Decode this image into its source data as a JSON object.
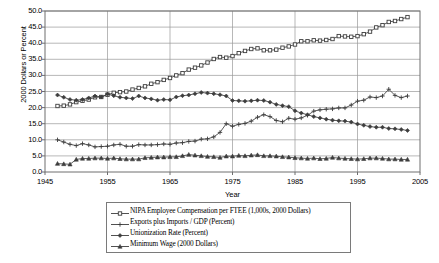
{
  "chart_data": {
    "type": "line",
    "title": "",
    "xlabel": "Year",
    "ylabel": "2000 Dollars or Percent",
    "xlim": [
      1945,
      2005
    ],
    "ylim": [
      0.0,
      50.0
    ],
    "xticks": [
      "1945",
      "1955",
      "1965",
      "1975",
      "1985",
      "1995",
      "2005"
    ],
    "xtick_values": [
      1945,
      1955,
      1965,
      1975,
      1985,
      1995,
      2005
    ],
    "yticks": [
      "0.0",
      "5.0",
      "10.0",
      "15.0",
      "20.0",
      "25.0",
      "30.0",
      "35.0",
      "40.0",
      "45.0",
      "50.0"
    ],
    "ytick_values": [
      0,
      5,
      10,
      15,
      20,
      25,
      30,
      35,
      40,
      45,
      50
    ],
    "grid": "horizontal-and-vertical",
    "legend_position": "below-plot",
    "x": [
      1947,
      1948,
      1949,
      1950,
      1951,
      1952,
      1953,
      1954,
      1955,
      1956,
      1957,
      1958,
      1959,
      1960,
      1961,
      1962,
      1963,
      1964,
      1965,
      1966,
      1967,
      1968,
      1969,
      1970,
      1971,
      1972,
      1973,
      1974,
      1975,
      1976,
      1977,
      1978,
      1979,
      1980,
      1981,
      1982,
      1983,
      1984,
      1985,
      1986,
      1987,
      1988,
      1989,
      1990,
      1991,
      1992,
      1993,
      1994,
      1995,
      1996,
      1997,
      1998,
      1999,
      2000,
      2001,
      2002,
      2003
    ],
    "series": [
      {
        "name": "NIPA Employee Compensation per FTEE (1,000s, 2000 Dollars)",
        "marker": "square",
        "values": [
          20.5,
          20.6,
          21.0,
          21.7,
          22.1,
          22.5,
          23.2,
          23.3,
          24.0,
          24.6,
          24.8,
          25.0,
          25.6,
          26.1,
          26.6,
          27.4,
          27.9,
          28.6,
          29.2,
          30.0,
          30.7,
          31.8,
          32.4,
          33.1,
          34.0,
          35.1,
          35.7,
          35.5,
          36.0,
          36.9,
          37.6,
          38.2,
          38.4,
          37.8,
          37.8,
          38.0,
          38.6,
          39.0,
          39.6,
          40.6,
          40.6,
          40.9,
          40.8,
          41.0,
          41.3,
          42.2,
          42.1,
          42.0,
          42.2,
          42.8,
          43.6,
          44.9,
          45.6,
          46.6,
          46.9,
          47.5,
          48.1
        ]
      },
      {
        "name": "Exports plus Imports / GDP (Percent)",
        "marker": "plus",
        "values": [
          10.0,
          9.3,
          8.6,
          8.2,
          8.8,
          8.4,
          7.8,
          7.9,
          8.0,
          8.4,
          8.6,
          8.0,
          8.0,
          8.5,
          8.4,
          8.4,
          8.5,
          8.7,
          8.6,
          9.0,
          9.1,
          9.5,
          9.6,
          10.2,
          10.3,
          10.9,
          12.3,
          15.0,
          14.2,
          14.8,
          15.1,
          15.8,
          17.0,
          17.8,
          17.2,
          16.0,
          15.6,
          16.7,
          16.4,
          16.8,
          17.6,
          18.9,
          19.3,
          19.5,
          19.6,
          19.9,
          19.9,
          20.8,
          22.0,
          22.3,
          23.3,
          23.1,
          23.6,
          25.7,
          23.8,
          23.1,
          23.6
        ]
      },
      {
        "name": "Unionization Rate (Percent)",
        "marker": "diamond",
        "values": [
          23.9,
          23.2,
          22.5,
          22.3,
          22.5,
          23.0,
          23.6,
          23.3,
          24.2,
          23.7,
          23.2,
          23.0,
          22.8,
          23.6,
          23.0,
          22.7,
          22.3,
          22.5,
          22.4,
          23.3,
          23.7,
          23.9,
          24.3,
          24.7,
          24.5,
          24.3,
          24.0,
          23.6,
          22.2,
          22.1,
          22.0,
          22.1,
          22.3,
          22.2,
          21.7,
          21.0,
          20.6,
          20.3,
          19.0,
          18.3,
          17.8,
          17.2,
          16.8,
          16.4,
          16.1,
          15.9,
          15.8,
          15.5,
          14.9,
          14.5,
          14.1,
          13.9,
          13.9,
          13.5,
          13.4,
          13.2,
          12.9
        ]
      },
      {
        "name": "Minimum Wage (2000 Dollars)",
        "marker": "triangle",
        "values": [
          2.6,
          2.5,
          2.4,
          3.9,
          4.2,
          4.2,
          4.3,
          4.3,
          4.2,
          4.3,
          4.1,
          4.0,
          4.0,
          4.0,
          4.4,
          4.5,
          4.6,
          4.6,
          4.7,
          4.7,
          5.0,
          5.4,
          5.2,
          5.0,
          4.8,
          4.7,
          4.5,
          4.9,
          4.9,
          5.1,
          5.0,
          5.2,
          5.3,
          5.0,
          5.0,
          4.9,
          4.7,
          4.6,
          4.4,
          4.3,
          4.2,
          4.3,
          4.1,
          4.2,
          4.5,
          4.3,
          4.2,
          4.1,
          4.0,
          4.1,
          4.3,
          4.3,
          4.2,
          4.0,
          4.0,
          3.9,
          3.9
        ]
      }
    ]
  },
  "legend": {
    "items": [
      {
        "label": "NIPA Employee Compensation per FTEE (1,000s, 2000 Dollars)",
        "marker": "square"
      },
      {
        "label": "Exports plus Imports / GDP (Percent)",
        "marker": "plus"
      },
      {
        "label": "Unionization Rate (Percent)",
        "marker": "diamond"
      },
      {
        "label": "Minimum Wage (2000 Dollars)",
        "marker": "triangle"
      }
    ]
  },
  "colors": {
    "line": "#3d3d3d",
    "grid": "#9a9a9a",
    "frame": "#6e6e6e",
    "text": "#000000",
    "background": "#ffffff"
  }
}
